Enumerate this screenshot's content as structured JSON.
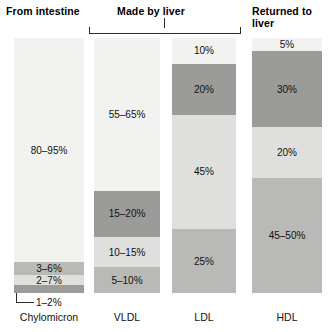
{
  "headers": {
    "intestine": "From intestine",
    "liver": "Made by liver",
    "returned": "Returned to liver"
  },
  "callout": {
    "chylomicron_smallest": "1–2%"
  },
  "chart_data": {
    "type": "bar",
    "title": "",
    "subtitle": "",
    "xlabel": "",
    "ylabel": "",
    "ylim": [
      0,
      100
    ],
    "grid": false,
    "legend_position": "none",
    "stacked": true,
    "orientation": "vertical",
    "categories": [
      "Chylomicron",
      "VLDL",
      "LDL",
      "HDL"
    ],
    "group_headers": [
      {
        "label": "From intestine",
        "categories": [
          "Chylomicron"
        ],
        "bracket": false
      },
      {
        "label": "Made by liver",
        "categories": [
          "VLDL",
          "LDL"
        ],
        "bracket": true
      },
      {
        "label": "Returned to liver",
        "categories": [
          "HDL"
        ],
        "bracket": false
      }
    ],
    "tones": {
      "tone-1": "#f2f2f1",
      "tone-2": "#dfdfde",
      "tone-3": "#b9b9b7",
      "tone-4": "#9b9b99"
    },
    "bars": [
      {
        "category": "Chylomicron",
        "segments": [
          {
            "label": "80–95%",
            "value": 88,
            "tone": "tone-1",
            "label_shown": true
          },
          {
            "label": "3–6%",
            "value": 5,
            "tone": "tone-3",
            "label_shown": true
          },
          {
            "label": "2–7%",
            "value": 4,
            "tone": "tone-2",
            "label_shown": true
          },
          {
            "label": "1–2%",
            "value": 3,
            "tone": "tone-4",
            "label_shown": false,
            "callout": true
          }
        ]
      },
      {
        "category": "VLDL",
        "segments": [
          {
            "label": "55–65%",
            "value": 60,
            "tone": "tone-1",
            "label_shown": true
          },
          {
            "label": "15–20%",
            "value": 18,
            "tone": "tone-4",
            "label_shown": true
          },
          {
            "label": "10–15%",
            "value": 12,
            "tone": "tone-2",
            "label_shown": true
          },
          {
            "label": "5–10%",
            "value": 10,
            "tone": "tone-3",
            "label_shown": true
          }
        ]
      },
      {
        "category": "LDL",
        "segments": [
          {
            "label": "10%",
            "value": 10,
            "tone": "tone-1",
            "label_shown": true
          },
          {
            "label": "20%",
            "value": 20,
            "tone": "tone-4",
            "label_shown": true
          },
          {
            "label": "45%",
            "value": 45,
            "tone": "tone-2",
            "label_shown": true
          },
          {
            "label": "25%",
            "value": 25,
            "tone": "tone-3",
            "label_shown": true
          }
        ]
      },
      {
        "category": "HDL",
        "segments": [
          {
            "label": "5%",
            "value": 5,
            "tone": "tone-1",
            "label_shown": true
          },
          {
            "label": "30%",
            "value": 30,
            "tone": "tone-4",
            "label_shown": true
          },
          {
            "label": "20%",
            "value": 20,
            "tone": "tone-2",
            "label_shown": true
          },
          {
            "label": "45–50%",
            "value": 45,
            "tone": "tone-3",
            "label_shown": true
          }
        ]
      }
    ]
  }
}
